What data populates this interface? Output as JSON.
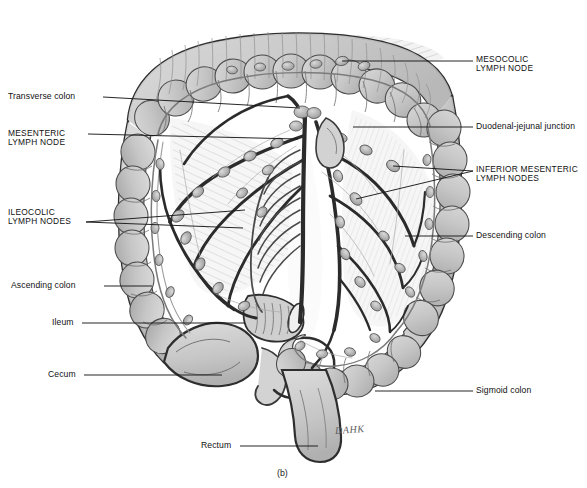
{
  "figure": {
    "caption": "(b)",
    "signature": "DAHK",
    "background_color": "#ffffff",
    "ink_color": "#1a1a1a",
    "organ_fill_color": "#c9c9c9",
    "organ_fill_light": "#dedede",
    "vessel_color": "#3a3a3a",
    "node_color": "#a8a8a8"
  },
  "labels_left": [
    {
      "id": "transverse-colon",
      "text": "Transverse colon",
      "style": "lower",
      "x": 8,
      "y": 92,
      "leaders": [
        [
          103,
          97,
          300,
          108
        ]
      ]
    },
    {
      "id": "mesenteric-lymph-node",
      "text": "MESENTERIC\nLYMPH NODE",
      "style": "caps",
      "x": 8,
      "y": 129,
      "leaders": [
        [
          88,
          134,
          298,
          139
        ]
      ]
    },
    {
      "id": "ileocolic-lymph-nodes",
      "text": "ILEOCOLIC\nLYMPH NODES",
      "style": "caps",
      "x": 8,
      "y": 208,
      "leaders": [
        [
          86,
          222,
          245,
          210
        ],
        [
          86,
          222,
          243,
          228
        ]
      ]
    },
    {
      "id": "ascending-colon",
      "text": "Ascending colon",
      "style": "lower",
      "x": 11,
      "y": 281,
      "leaders": [
        [
          104,
          286,
          152,
          286
        ]
      ]
    },
    {
      "id": "ileum",
      "text": "Ileum",
      "style": "lower",
      "x": 52,
      "y": 318,
      "leaders": [
        [
          82,
          323,
          245,
          323
        ]
      ]
    },
    {
      "id": "cecum",
      "text": "Cecum",
      "style": "lower",
      "x": 48,
      "y": 370,
      "leaders": [
        [
          84,
          375,
          222,
          375
        ]
      ]
    },
    {
      "id": "rectum",
      "text": "Rectum",
      "style": "lower",
      "x": 201,
      "y": 441,
      "leaders": [
        [
          240,
          446,
          318,
          446
        ]
      ]
    }
  ],
  "labels_right": [
    {
      "id": "mesocolic-lymph-node",
      "text": "MESOCOLIC\nLYMPH NODE",
      "style": "caps",
      "x": 476,
      "y": 55,
      "leaders": [
        [
          473,
          61,
          342,
          61
        ]
      ]
    },
    {
      "id": "duodenal-jejunal-junction",
      "text": "Duodenal-jejunal junction",
      "style": "lower",
      "x": 476,
      "y": 122,
      "leaders": [
        [
          473,
          127,
          353,
          127
        ]
      ]
    },
    {
      "id": "inferior-mesenteric-lymph-nodes",
      "text": "INFERIOR MESENTERIC\nLYMPH NODES",
      "style": "caps",
      "x": 476,
      "y": 165,
      "leaders": [
        [
          473,
          171,
          393,
          166
        ],
        [
          473,
          171,
          356,
          199
        ]
      ]
    },
    {
      "id": "descending-colon",
      "text": "Descending colon",
      "style": "lower",
      "x": 476,
      "y": 231,
      "leaders": [
        [
          473,
          236,
          405,
          236
        ]
      ]
    },
    {
      "id": "sigmoid-colon",
      "text": "Sigmoid colon",
      "style": "lower",
      "x": 476,
      "y": 386,
      "leaders": [
        [
          473,
          391,
          375,
          391
        ]
      ]
    }
  ],
  "anatomy_parts": [
    "transverse colon",
    "ascending colon",
    "descending colon",
    "sigmoid colon",
    "cecum",
    "ileum",
    "rectum",
    "appendix",
    "mesentery",
    "mesocolon",
    "superior mesenteric artery",
    "inferior mesenteric artery",
    "ileocolic artery",
    "lymph nodes"
  ]
}
